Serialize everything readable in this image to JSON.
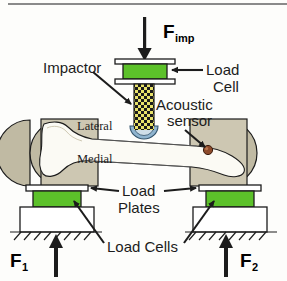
{
  "figure": {
    "background": "#fdfdfb"
  },
  "colors": {
    "load_cell_green": "#5cc12a",
    "potting_tan": "#c9c3ac",
    "bone_cream": "#fbfaf4",
    "impactor_yellow": "#e8e26a",
    "impactor_dark": "#1b1b1b",
    "sensor_brown": "#8d4a2a",
    "tip_blue": "#8fb4cf",
    "outline": "#1c1c1c",
    "plate_white": "#ffffff"
  },
  "labels": {
    "f_imp": "F",
    "f_imp_sub": "imp",
    "f1": "F",
    "f1_sub": "1",
    "f2": "F",
    "f2_sub": "2",
    "impactor": "Impactor",
    "load_cell_line1": "Load",
    "load_cell_line2": "Cell",
    "acoustic_line1": "Acoustic",
    "acoustic_line2": "sensor",
    "lateral": "Lateral",
    "medial": "Medial",
    "load_plates_line1": "Load",
    "load_plates_line2": "Plates",
    "load_cells": "Load Cells"
  },
  "components": {
    "impact_force_arrow": "downward-arrow",
    "support_force_arrow_left": "upward-arrow",
    "support_force_arrow_right": "upward-arrow",
    "impactor_rod": "checkered-rod",
    "impactor_tip": "semicircular-cup",
    "upper_load_cell": "green-block",
    "left_load_cell": "green-block",
    "right_load_cell": "green-block",
    "left_load_plate": "white-bar",
    "right_load_plate": "white-bar",
    "specimen": "long-bone",
    "left_potting": "tan-block-semicircle",
    "right_potting": "tan-block-semicircle",
    "acoustic_sensor": "brown-dot",
    "ground_left": "hatched-ground",
    "ground_right": "hatched-ground"
  }
}
